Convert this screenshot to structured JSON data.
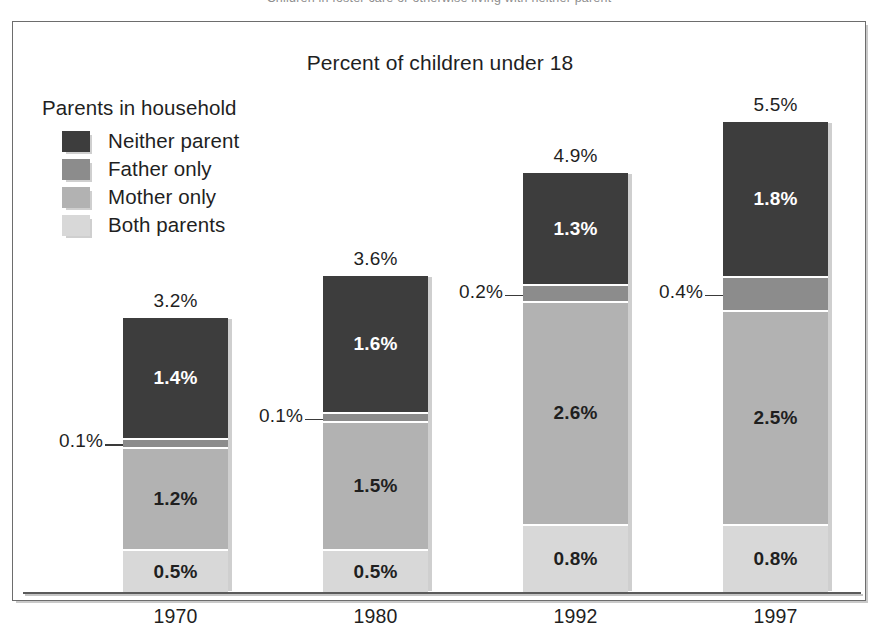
{
  "scan": {
    "cutoff_caption": "Children in foster care or otherwise living with neither parent"
  },
  "chart": {
    "title": "Percent of children under 18",
    "legend": {
      "title": "Parents in household",
      "items": [
        {
          "label": "Neither parent",
          "color": "#3d3d3d"
        },
        {
          "label": "Father only",
          "color": "#8c8c8c"
        },
        {
          "label": "Mother only",
          "color": "#b2b2b2"
        },
        {
          "label": "Both parents",
          "color": "#d8d8d8"
        }
      ]
    },
    "bars": [
      {
        "year": "1970",
        "total": "3.2%",
        "segments": [
          {
            "key": "both_parents",
            "label": "0.5%",
            "value": 0.5,
            "color": "#d8d8d8",
            "text": "dark",
            "inline": true
          },
          {
            "key": "mother_only",
            "label": "1.2%",
            "value": 1.2,
            "color": "#b2b2b2",
            "text": "dark",
            "inline": true
          },
          {
            "key": "father_only",
            "label": "0.1%",
            "value": 0.1,
            "color": "#8c8c8c",
            "text": "dark",
            "inline": false
          },
          {
            "key": "neither_parent",
            "label": "1.4%",
            "value": 1.4,
            "color": "#3d3d3d",
            "text": "light",
            "inline": true
          }
        ]
      },
      {
        "year": "1980",
        "total": "3.6%",
        "segments": [
          {
            "key": "both_parents",
            "label": "0.5%",
            "value": 0.5,
            "color": "#d8d8d8",
            "text": "dark",
            "inline": true
          },
          {
            "key": "mother_only",
            "label": "1.5%",
            "value": 1.5,
            "color": "#b2b2b2",
            "text": "dark",
            "inline": true
          },
          {
            "key": "father_only",
            "label": "0.1%",
            "value": 0.1,
            "color": "#8c8c8c",
            "text": "dark",
            "inline": false
          },
          {
            "key": "neither_parent",
            "label": "1.6%",
            "value": 1.6,
            "color": "#3d3d3d",
            "text": "light",
            "inline": true
          }
        ]
      },
      {
        "year": "1992",
        "total": "4.9%",
        "segments": [
          {
            "key": "both_parents",
            "label": "0.8%",
            "value": 0.8,
            "color": "#d8d8d8",
            "text": "dark",
            "inline": true
          },
          {
            "key": "mother_only",
            "label": "2.6%",
            "value": 2.6,
            "color": "#b2b2b2",
            "text": "dark",
            "inline": true
          },
          {
            "key": "father_only",
            "label": "0.2%",
            "value": 0.2,
            "color": "#8c8c8c",
            "text": "dark",
            "inline": false
          },
          {
            "key": "neither_parent",
            "label": "1.3%",
            "value": 1.3,
            "color": "#3d3d3d",
            "text": "light",
            "inline": true
          }
        ]
      },
      {
        "year": "1997",
        "total": "5.5%",
        "segments": [
          {
            "key": "both_parents",
            "label": "0.8%",
            "value": 0.8,
            "color": "#d8d8d8",
            "text": "dark",
            "inline": true
          },
          {
            "key": "mother_only",
            "label": "2.5%",
            "value": 2.5,
            "color": "#b2b2b2",
            "text": "dark",
            "inline": true
          },
          {
            "key": "father_only",
            "label": "0.4%",
            "value": 0.4,
            "color": "#8c8c8c",
            "text": "dark",
            "inline": false
          },
          {
            "key": "neither_parent",
            "label": "1.8%",
            "value": 1.8,
            "color": "#3d3d3d",
            "text": "light",
            "inline": true
          }
        ]
      }
    ]
  },
  "chart_data": {
    "type": "bar",
    "subtype": "stacked-vertical",
    "title": "Percent of children under 18",
    "xlabel": "",
    "ylabel": "",
    "ylim": [
      0,
      6.0
    ],
    "grid": false,
    "legend_position": "top-left-inside",
    "legend_title": "Parents in household",
    "categories": [
      "1970",
      "1980",
      "1992",
      "1997"
    ],
    "stack_order_bottom_to_top": [
      "Both parents",
      "Mother only",
      "Father only",
      "Neither parent"
    ],
    "series": [
      {
        "name": "Both parents",
        "color": "#d8d8d8",
        "values": [
          0.5,
          0.5,
          0.8,
          0.8
        ],
        "labels": [
          "0.5%",
          "0.5%",
          "0.8%",
          "0.8%"
        ]
      },
      {
        "name": "Mother only",
        "color": "#b2b2b2",
        "values": [
          1.2,
          1.5,
          2.6,
          2.5
        ],
        "labels": [
          "1.2%",
          "1.5%",
          "2.6%",
          "2.5%"
        ]
      },
      {
        "name": "Father only",
        "color": "#8c8c8c",
        "values": [
          0.1,
          0.1,
          0.2,
          0.4
        ],
        "labels": [
          "0.1%",
          "0.1%",
          "0.2%",
          "0.4%"
        ]
      },
      {
        "name": "Neither parent",
        "color": "#3d3d3d",
        "values": [
          1.4,
          1.6,
          1.3,
          1.8
        ],
        "labels": [
          "1.4%",
          "1.6%",
          "1.3%",
          "1.8%"
        ]
      }
    ],
    "totals": [
      3.2,
      3.6,
      4.9,
      5.5
    ],
    "total_labels": [
      "3.2%",
      "3.6%",
      "4.9%",
      "5.5%"
    ],
    "units": "percent"
  }
}
